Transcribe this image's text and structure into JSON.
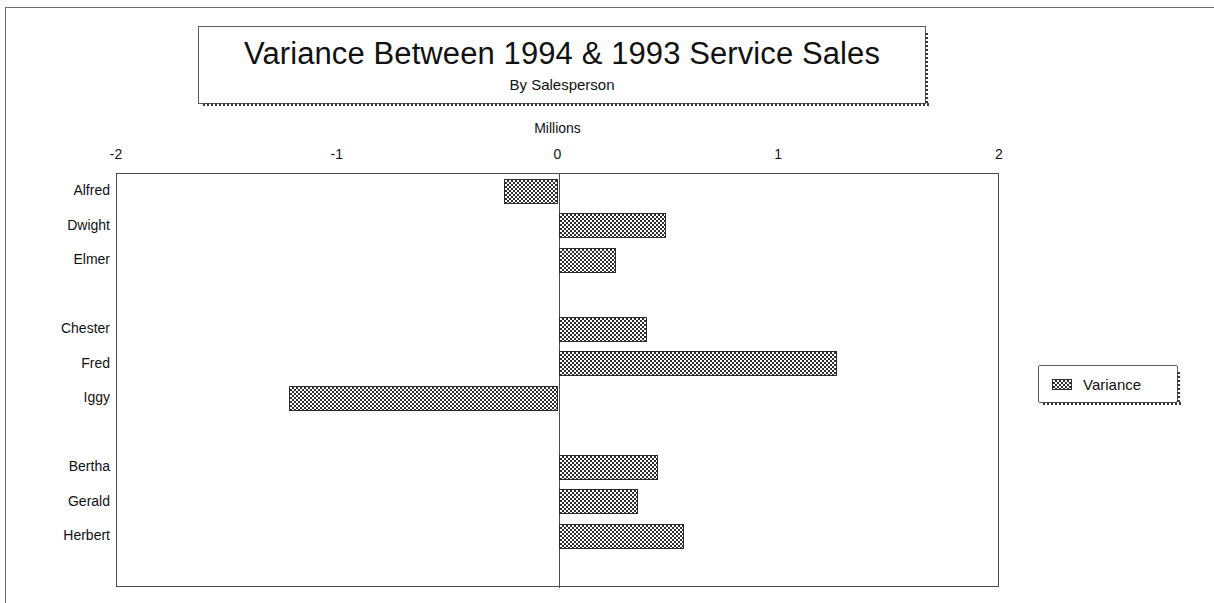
{
  "title": {
    "main": "Variance Between 1994 & 1993 Service Sales",
    "sub": "By Salesperson"
  },
  "legend": {
    "label": "Variance",
    "swatch_icon": "hatch-pattern-swatch-icon"
  },
  "chart_data": {
    "type": "bar",
    "orientation": "horizontal",
    "title": "Variance Between 1994 & 1993 Service Sales",
    "subtitle": "By Salesperson",
    "xlabel": "Millions",
    "ylabel": "",
    "xlim": [
      -2,
      2
    ],
    "xticks": [
      -2,
      -1,
      0,
      1,
      2
    ],
    "xtick_labels": [
      "-2",
      "-1",
      "0",
      "1",
      "2"
    ],
    "grid": false,
    "legend_position": "right",
    "series": [
      {
        "name": "Variance",
        "values": [
          -0.245,
          0.485,
          0.26,
          null,
          0.4,
          1.26,
          -1.22,
          null,
          0.45,
          0.36,
          0.57,
          null
        ]
      }
    ],
    "categories": [
      "Alfred",
      "Dwight",
      "Elmer",
      "",
      "Chester",
      "Fred",
      "Iggy",
      "",
      "Bertha",
      "Gerald",
      "Herbert",
      ""
    ]
  }
}
